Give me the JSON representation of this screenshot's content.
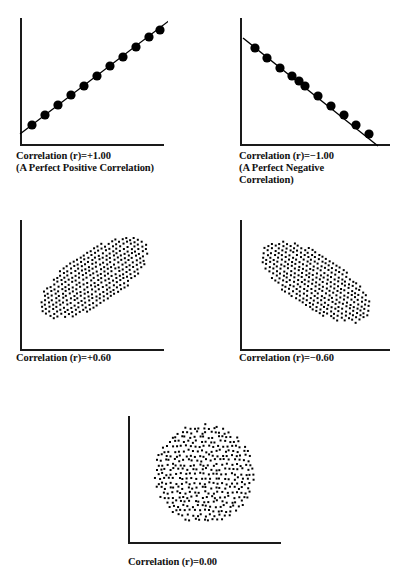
{
  "figure": {
    "width": 403,
    "height": 585,
    "background": "#ffffff",
    "ink": "#000000",
    "axis_color": "#1a1a1a",
    "axis_width": 2,
    "dot_color": "#000000"
  },
  "panels": [
    {
      "id": "perfect-positive",
      "caption_lines": [
        "Correlation (r)=+1.00",
        "(A Perfect Positive Correlation)"
      ],
      "caption_x": 16,
      "caption_y": 150,
      "plot": {
        "x": 18,
        "y": 14,
        "w": 150,
        "h": 136,
        "axis_origin_x": 3,
        "axis_top_y": 4,
        "axis_bottom_y": 131,
        "axis_right_x": 146
      },
      "chart_ref": 0
    },
    {
      "id": "perfect-negative",
      "caption_lines": [
        "Correlation (r)=−1.00",
        "(A Perfect Negative",
        "Correlation)"
      ],
      "caption_x": 239,
      "caption_y": 150,
      "plot": {
        "x": 238,
        "y": 14,
        "w": 156,
        "h": 136,
        "axis_origin_x": 3,
        "axis_top_y": 4,
        "axis_bottom_y": 131,
        "axis_right_x": 152
      },
      "chart_ref": 1
    },
    {
      "id": "moderate-positive",
      "caption_lines": [
        "Correlation (r)=+0.60"
      ],
      "caption_x": 16,
      "caption_y": 352,
      "plot": {
        "x": 18,
        "y": 216,
        "w": 150,
        "h": 136,
        "axis_origin_x": 3,
        "axis_top_y": 4,
        "axis_bottom_y": 134,
        "axis_right_x": 146
      },
      "chart_ref": 2
    },
    {
      "id": "moderate-negative",
      "caption_lines": [
        "Correlation (r)=−0.60"
      ],
      "caption_x": 239,
      "caption_y": 352,
      "plot": {
        "x": 238,
        "y": 216,
        "w": 156,
        "h": 136,
        "axis_origin_x": 3,
        "axis_top_y": 4,
        "axis_bottom_y": 134,
        "axis_right_x": 152
      },
      "chart_ref": 3
    },
    {
      "id": "zero-correlation",
      "caption_lines": [
        "Correlation (r)=0.00"
      ],
      "caption_x": 128,
      "caption_y": 556,
      "plot": {
        "x": 126,
        "y": 410,
        "w": 160,
        "h": 136,
        "axis_origin_x": 3,
        "axis_top_y": 6,
        "axis_bottom_y": 133,
        "axis_right_x": 155
      },
      "chart_ref": 4
    }
  ],
  "chart_data": [
    {
      "type": "scatter",
      "title": "Correlation (r)=+1.00",
      "subtitle": "(A Perfect Positive Correlation)",
      "r": 1.0,
      "xlabel": "",
      "ylabel": "",
      "grid": false,
      "legend": "none",
      "marker": "filled-circle",
      "marker_size": 4.6,
      "trendline": true,
      "trendline_from": [
        2,
        120
      ],
      "trendline_to": [
        152,
        6
      ],
      "x": [
        14,
        27,
        40,
        53,
        66,
        79,
        92,
        105,
        118,
        131,
        142
      ],
      "y": [
        111,
        101,
        91,
        81,
        72,
        62,
        52,
        43,
        33,
        23,
        16
      ]
    },
    {
      "type": "scatter",
      "title": "Correlation (r)=−1.00",
      "subtitle": "(A Perfect Negative Correlation)",
      "r": -1.0,
      "xlabel": "",
      "ylabel": "",
      "grid": false,
      "legend": "none",
      "marker": "filled-circle",
      "marker_size": 4.6,
      "trendline": true,
      "trendline_from": [
        5,
        24
      ],
      "trendline_to": [
        140,
        132
      ],
      "x": [
        17,
        29,
        42,
        54,
        61,
        67,
        80,
        93,
        106,
        118,
        131
      ],
      "y": [
        34,
        44,
        54,
        62,
        67,
        72,
        82,
        92,
        101,
        111,
        120
      ]
    },
    {
      "type": "scatter",
      "title": "Correlation (r)=+0.60",
      "r": 0.6,
      "xlabel": "",
      "ylabel": "",
      "grid": false,
      "legend": "none",
      "marker": "filled-square",
      "marker_size": 2.0,
      "cloud": {
        "shape": "ellipse",
        "center": [
          76,
          62
        ],
        "semi_major": 62,
        "semi_minor": 27,
        "angle_deg": -33,
        "lattice_spacing": 4.1,
        "jitter": 0.55,
        "point_count": 340
      }
    },
    {
      "type": "scatter",
      "title": "Correlation (r)=−0.60",
      "r": -0.6,
      "xlabel": "",
      "ylabel": "",
      "grid": false,
      "legend": "none",
      "marker": "filled-square",
      "marker_size": 2.0,
      "cloud": {
        "shape": "ellipse",
        "center": [
          78,
          66
        ],
        "semi_major": 63,
        "semi_minor": 27,
        "angle_deg": 33,
        "lattice_spacing": 4.1,
        "jitter": 0.55,
        "point_count": 340
      }
    },
    {
      "type": "scatter",
      "title": "Correlation (r)=0.00",
      "r": 0.0,
      "xlabel": "",
      "ylabel": "",
      "grid": false,
      "legend": "none",
      "marker": "filled-square",
      "marker_size": 2.0,
      "cloud": {
        "shape": "circle",
        "center": [
          78,
          64
        ],
        "semi_major": 50,
        "semi_minor": 50,
        "angle_deg": 0,
        "lattice_spacing": 4.6,
        "jitter": 1.35,
        "point_count": 330
      }
    }
  ]
}
